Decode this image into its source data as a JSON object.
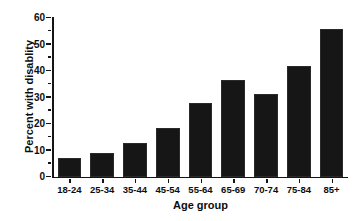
{
  "chart_data": {
    "type": "bar",
    "title": "",
    "xlabel": "Age group",
    "ylabel": "Percent with disablity",
    "categories": [
      "18-24",
      "25-34",
      "35-44",
      "45-54",
      "55-64",
      "65-69",
      "70-74",
      "75-84",
      "85+"
    ],
    "values": [
      7,
      9,
      13,
      18.5,
      28,
      36.5,
      31.5,
      42,
      56
    ],
    "ylim": [
      0,
      60
    ],
    "xlim_note": "categorical, 9 evenly spaced bars",
    "y_major_ticks": [
      0,
      10,
      20,
      30,
      40,
      50,
      60
    ],
    "y_tick_labels": [
      "0",
      "10",
      "20",
      "30",
      "40",
      "50",
      "60"
    ],
    "y_minor_ticks": [
      5,
      15,
      25,
      35,
      45,
      55
    ],
    "grid": false,
    "legend": false,
    "legend_position": "none",
    "bar_color": "#161616",
    "axis_color": "#141414",
    "background_color": "#ffffff",
    "spines": [
      "left",
      "bottom"
    ],
    "tick_direction": "out"
  }
}
